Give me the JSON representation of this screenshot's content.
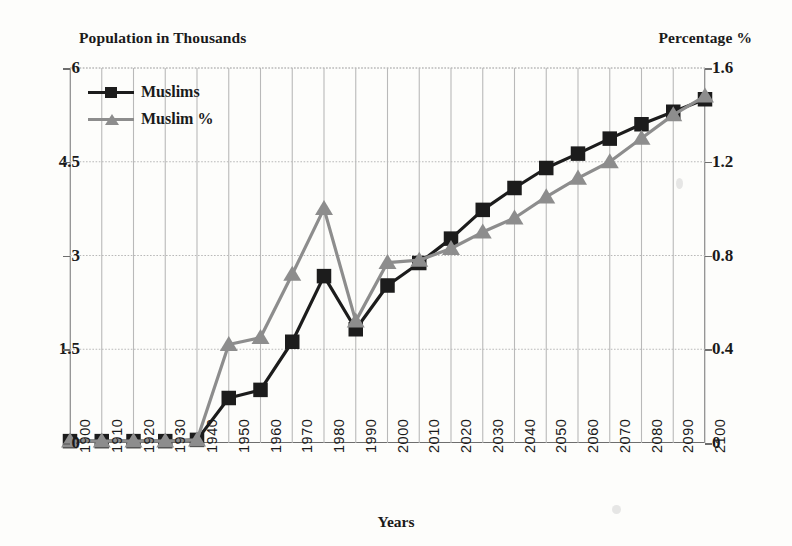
{
  "chart_data": {
    "type": "line",
    "title": "",
    "left_axis_title": "Population in Thousands",
    "right_axis_title": "Percentage %",
    "xlabel": "Years",
    "grid": true,
    "legend_position": "top-left",
    "categories": [
      "1900",
      "1910",
      "1920",
      "1930",
      "1940",
      "1950",
      "1960",
      "1970",
      "1980",
      "1990",
      "2000",
      "2010",
      "2020",
      "2030",
      "2040",
      "2050",
      "2060",
      "2070",
      "2080",
      "2090",
      "2100"
    ],
    "left_ticks": [
      "0",
      "1.5",
      "3",
      "4.5",
      "6"
    ],
    "left_tick_values": [
      0,
      1.5,
      3,
      4.5,
      6
    ],
    "right_ticks": [
      "0",
      "0.4",
      "0.8",
      "1.2",
      "1.6"
    ],
    "right_tick_values": [
      0,
      0.4,
      0.8,
      1.2,
      1.6
    ],
    "ylim": [
      0,
      6
    ],
    "ylim_right": [
      0,
      1.6
    ],
    "series": [
      {
        "name": "Muslims",
        "axis": "left",
        "color": "#1c1c1c",
        "marker": "square",
        "values": [
          0.03,
          0.03,
          0.03,
          0.03,
          0.05,
          0.72,
          0.85,
          1.62,
          2.67,
          1.82,
          2.52,
          2.88,
          3.27,
          3.73,
          4.08,
          4.4,
          4.63,
          4.87,
          5.1,
          5.3,
          5.5
        ]
      },
      {
        "name": "Muslim %",
        "axis": "right",
        "color": "#8d8d8d",
        "marker": "triangle",
        "values": [
          0.008,
          0.008,
          0.008,
          0.008,
          0.013,
          0.42,
          0.45,
          0.72,
          1.0,
          0.52,
          0.77,
          0.78,
          0.83,
          0.9,
          0.96,
          1.05,
          1.13,
          1.2,
          1.3,
          1.4,
          1.48
        ]
      }
    ]
  },
  "legend": {
    "items": [
      {
        "label": "Muslims"
      },
      {
        "label": "Muslim %"
      }
    ]
  },
  "colors": {
    "series_black": "#1c1c1c",
    "series_gray": "#8d8d8d",
    "axis": "#6e6e6e",
    "grid": "#b9b9b9"
  }
}
